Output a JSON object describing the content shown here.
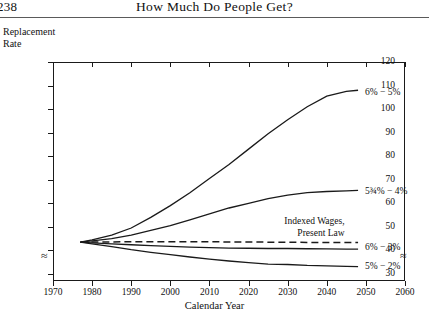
{
  "page": {
    "folio": "238",
    "running_head": "How Much Do People Get?"
  },
  "axis_titles": {
    "y_line1": "Replacement",
    "y_line2": "Rate",
    "x": "Calendar Year"
  },
  "chart_data": {
    "type": "line",
    "title": "How Much Do People Get?",
    "xlabel": "Calendar Year",
    "ylabel": "Replacement Rate",
    "xlim": [
      1970,
      2060
    ],
    "ylim": [
      27,
      120
    ],
    "y_axis_break_below": 30,
    "grid": false,
    "legend": "inline-end-labels",
    "xticks": [
      1970,
      1980,
      1990,
      2000,
      2010,
      2020,
      2030,
      2040,
      2050,
      2060
    ],
    "yticks": [
      30,
      40,
      50,
      60,
      70,
      80,
      90,
      100,
      110,
      120
    ],
    "series": [
      {
        "name": "6% - 5%",
        "label": "6% − 5%",
        "style": "solid",
        "label_x": 2050,
        "label_y": 107,
        "x": [
          1977,
          1980,
          1985,
          1990,
          1995,
          2000,
          2005,
          2010,
          2015,
          2020,
          2025,
          2030,
          2035,
          2040,
          2045,
          2048
        ],
        "y": [
          43.5,
          44.5,
          46.5,
          49.5,
          54.0,
          59.0,
          64.5,
          70.5,
          76.5,
          83.0,
          89.5,
          95.5,
          101.0,
          105.5,
          107.5,
          108.0
        ]
      },
      {
        "name": "5 3/4% - 4%",
        "label": "5¾% − 4%",
        "style": "solid",
        "label_x": 2050,
        "label_y": 65,
        "x": [
          1977,
          1980,
          1985,
          1990,
          1995,
          2000,
          2005,
          2010,
          2015,
          2020,
          2025,
          2030,
          2035,
          2040,
          2045,
          2048
        ],
        "y": [
          43.5,
          44.0,
          45.0,
          46.5,
          48.5,
          50.5,
          53.0,
          55.5,
          58.0,
          60.0,
          62.0,
          63.5,
          64.5,
          65.0,
          65.3,
          65.5
        ]
      },
      {
        "name": "Indexed Wages, Present Law",
        "label_line1": "Indexed Wages,",
        "label_line2": "Present Law",
        "style": "dashed",
        "label_x": 2045,
        "label_y": 52,
        "x": [
          1977,
          1985,
          1995,
          2005,
          2015,
          2025,
          2035,
          2045,
          2048
        ],
        "y": [
          43.5,
          43.6,
          43.7,
          43.7,
          43.6,
          43.5,
          43.4,
          43.3,
          43.3
        ]
      },
      {
        "name": "6% - 3%",
        "label": "6% − 3%",
        "style": "solid",
        "label_x": 2050,
        "label_y": 41,
        "x": [
          1977,
          1980,
          1985,
          1990,
          1995,
          2000,
          2005,
          2010,
          2015,
          2020,
          2025,
          2030,
          2035,
          2040,
          2045,
          2048
        ],
        "y": [
          43.5,
          43.2,
          42.8,
          42.4,
          42.0,
          41.7,
          41.4,
          41.2,
          41.0,
          40.9,
          40.8,
          40.8,
          40.7,
          40.6,
          40.5,
          40.5
        ]
      },
      {
        "name": "5% - 2%",
        "label": "5% − 2%",
        "style": "solid",
        "label_x": 2050,
        "label_y": 33,
        "x": [
          1977,
          1980,
          1985,
          1990,
          1995,
          2000,
          2005,
          2010,
          2015,
          2020,
          2025,
          2030,
          2035,
          2040,
          2045,
          2048
        ],
        "y": [
          43.5,
          42.8,
          41.6,
          40.3,
          39.2,
          38.2,
          37.2,
          36.3,
          35.5,
          34.8,
          34.2,
          34.0,
          33.6,
          33.4,
          33.2,
          33.1
        ]
      }
    ]
  }
}
